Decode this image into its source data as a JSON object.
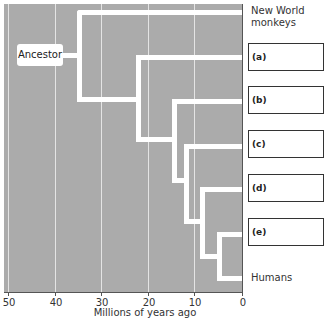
{
  "diagram": {
    "type": "phylogenetic-tree",
    "ancestor_label": "Ancestor",
    "tips": {
      "top": "New World monkeys",
      "top_line1": "New World",
      "top_line2": "monkeys",
      "bottom": "Humans"
    },
    "answer_boxes": [
      {
        "label": "(a)",
        "value": ""
      },
      {
        "label": "(b)",
        "value": ""
      },
      {
        "label": "(c)",
        "value": ""
      },
      {
        "label": "(d)",
        "value": ""
      },
      {
        "label": "(e)",
        "value": ""
      }
    ],
    "axis": {
      "title": "Millions of years ago",
      "ticks": [
        "50",
        "40",
        "30",
        "20",
        "10",
        "0"
      ]
    },
    "branch_points_mya": [
      35,
      22,
      14,
      11,
      8,
      5
    ],
    "colors": {
      "background": "#ababab",
      "branches": "#ffffff",
      "gridlines": "#e4e4e4"
    }
  }
}
